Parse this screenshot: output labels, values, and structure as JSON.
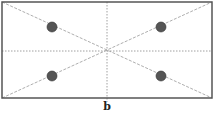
{
  "figure": {
    "caption": "b",
    "rectangle": {
      "x": 2,
      "y": 2,
      "width": 210,
      "height": 96,
      "stroke": "#555555"
    },
    "center": {
      "x": 107,
      "y": 51
    },
    "lines": {
      "diagonals": "dashed",
      "center_axes": "dotted",
      "color": "#888888"
    },
    "points": [
      {
        "x": 52,
        "y": 27,
        "r": 5
      },
      {
        "x": 161,
        "y": 27,
        "r": 5
      },
      {
        "x": 52,
        "y": 76,
        "r": 5
      },
      {
        "x": 161,
        "y": 76,
        "r": 5
      }
    ],
    "point_color": "#555555"
  }
}
